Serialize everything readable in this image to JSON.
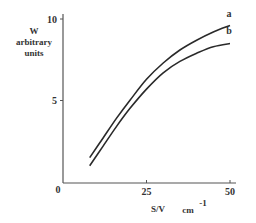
{
  "chart_data": {
    "type": "line",
    "title": "",
    "xlabel": "S/V",
    "xlabel_unit": "cm",
    "xlabel_unit_exp": "-1",
    "ylabel_lines": [
      "W",
      "arbitrary",
      "units"
    ],
    "xlim": [
      0,
      50
    ],
    "ylim": [
      0,
      10
    ],
    "x_ticks": [
      {
        "value": 0,
        "label": "0"
      },
      {
        "value": 25,
        "label": "25"
      },
      {
        "value": 50,
        "label": "50"
      }
    ],
    "y_ticks": [
      {
        "value": 5,
        "label": "5"
      },
      {
        "value": 10,
        "label": "10"
      }
    ],
    "grid": false,
    "legend": "inline labels at curve ends",
    "series": [
      {
        "name": "a",
        "x": [
          8,
          12,
          16,
          20,
          25,
          30,
          35,
          40,
          45,
          50
        ],
        "y": [
          1.5,
          2.7,
          3.9,
          5.0,
          6.3,
          7.3,
          8.1,
          8.7,
          9.2,
          9.6
        ]
      },
      {
        "name": "b",
        "x": [
          8,
          12,
          16,
          20,
          25,
          30,
          35,
          40,
          45,
          50
        ],
        "y": [
          1.0,
          2.2,
          3.4,
          4.5,
          5.7,
          6.7,
          7.4,
          7.9,
          8.3,
          8.5
        ]
      }
    ]
  },
  "colors": {
    "line": "#2a2a2a",
    "axis": "#555555",
    "text": "#333333"
  }
}
